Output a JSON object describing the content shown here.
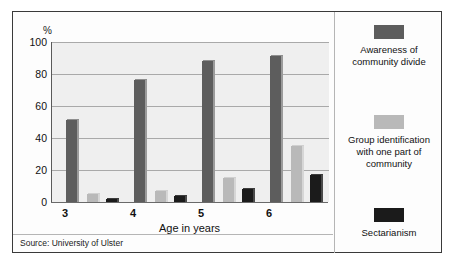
{
  "chart_data": {
    "type": "bar",
    "title": "",
    "xlabel": "Age in years",
    "ylabel": "%",
    "unit_label": "%",
    "categories": [
      "3",
      "4",
      "5",
      "6"
    ],
    "ylim": [
      0,
      100
    ],
    "yticks": [
      "0",
      "20",
      "40",
      "60",
      "80",
      "100"
    ],
    "grid": true,
    "legend_position": "right",
    "series": [
      {
        "name": "Awareness of community divide",
        "color": "#5d5d5d",
        "values": [
          51,
          76,
          88,
          91
        ]
      },
      {
        "name": "Group identification with one part of community",
        "color": "#b9b9b9",
        "values": [
          5,
          7,
          15,
          35
        ]
      },
      {
        "name": "Sectarianism",
        "color": "#1b1b1b",
        "values": [
          2,
          4,
          8,
          17
        ]
      }
    ],
    "source": "Source: University of Ulster"
  },
  "legend": {
    "items": [
      {
        "label_line1": "Awareness of",
        "label_line2": "community divide",
        "label_line3": ""
      },
      {
        "label_line1": "Group identification",
        "label_line2": "with one part of",
        "label_line3": "community"
      },
      {
        "label_line1": "Sectarianism",
        "label_line2": "",
        "label_line3": ""
      }
    ]
  },
  "colors": {
    "series1": "#5d5d5d",
    "series2": "#b9b9b9",
    "series3": "#1b1b1b",
    "plot_background": "#efefef",
    "frame_border": "#3a3a3a",
    "gridline": "#a9a9a9"
  }
}
